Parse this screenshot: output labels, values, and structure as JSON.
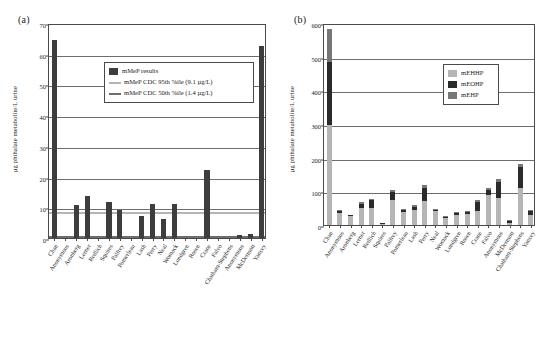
{
  "figure": {
    "panel_a_label": "(a)",
    "panel_b_label": "(b)"
  },
  "chart_data": [
    {
      "type": "bar",
      "panel": "(a)",
      "title": "",
      "xlabel": "",
      "ylabel": "µg phthalate metabolite/L urine",
      "ylim": [
        0,
        70
      ],
      "yticks": [
        0,
        10,
        20,
        30,
        40,
        50,
        60,
        70
      ],
      "grid": true,
      "legend_position": "upper-center",
      "legend": [
        {
          "label": "mMeP results",
          "type": "bar",
          "color": "#3d3d3d"
        },
        {
          "label": "mMeP CDC 95th %ile (9.1 µg/L)",
          "type": "line",
          "color": "#b5b5b5"
        },
        {
          "label": "mMeP CDC 50th %ile (1.4 µg/L)",
          "type": "line",
          "color": "#6d6d6d"
        }
      ],
      "reference_lines": [
        {
          "label": "mMeP CDC 95th %ile",
          "value": 9.1,
          "color": "#b5b5b5"
        },
        {
          "label": "mMeP CDC 50th %ile",
          "value": 1.4,
          "color": "#6d6d6d"
        }
      ],
      "categories": [
        "Chan",
        "Anonymous",
        "Aronberg",
        "Lerner",
        "Redlich",
        "Squires",
        "Palfrey",
        "Pomerleau",
        "Lash",
        "Perry",
        "Neal",
        "Womack",
        "Lundgren",
        "Rosen",
        "Crane",
        "Falvo",
        "Chatham-Stephens",
        "Anonymous",
        "McDermott",
        "Yancey"
      ],
      "series": [
        {
          "name": "mMeP results",
          "color": "#3d3d3d",
          "values": [
            64.5,
            0,
            10.9,
            13.7,
            0,
            11.8,
            9.1,
            0,
            7.2,
            11.2,
            6.2,
            11.2,
            0,
            0,
            22.3,
            0,
            0,
            1.1,
            1.2,
            62.5
          ]
        }
      ]
    },
    {
      "type": "bar",
      "panel": "(b)",
      "stacked": true,
      "title": "",
      "xlabel": "",
      "ylabel": "µg phthalate metabolite/L urine",
      "ylim": [
        0,
        600
      ],
      "yticks": [
        0,
        100,
        200,
        300,
        400,
        500,
        600
      ],
      "grid": true,
      "legend_position": "upper-right",
      "legend": [
        {
          "label": "mEHHP",
          "color": "#b5b5b5"
        },
        {
          "label": "mEOHP",
          "color": "#2b2b2b"
        },
        {
          "label": "mEHP",
          "color": "#777777"
        }
      ],
      "categories": [
        "Chan",
        "Anonymous",
        "Aronberg",
        "Lerner",
        "Redlich",
        "Squires",
        "Palfrey",
        "Pomerleau",
        "Lash",
        "Perry",
        "Neal",
        "Womack",
        "Lundgren",
        "Rosen",
        "Crane",
        "Falvo",
        "Anonymous",
        "McDermott",
        "Chatham-Stephens",
        "Yancey"
      ],
      "series": [
        {
          "name": "mEHHP",
          "color": "#b5b5b5",
          "values": [
            298,
            36,
            27,
            50,
            52,
            6,
            74,
            40,
            44,
            72,
            41,
            22,
            31,
            33,
            43,
            88,
            79,
            5,
            110,
            29
          ]
        },
        {
          "name": "mEOHP",
          "color": "#2b2b2b",
          "values": [
            186,
            6,
            3,
            13,
            21,
            1,
            25,
            5,
            10,
            38,
            4,
            4,
            5,
            6,
            24,
            17,
            50,
            7,
            62,
            12
          ]
        },
        {
          "name": "mEHP",
          "color": "#777777",
          "values": [
            99,
            3,
            0,
            4,
            5,
            0,
            6,
            2,
            4,
            8,
            2,
            1,
            2,
            3,
            6,
            6,
            8,
            3,
            8,
            4
          ]
        }
      ],
      "totals": [
        583,
        45,
        30,
        67,
        78,
        7,
        105,
        47,
        58,
        118,
        47,
        27,
        38,
        42,
        73,
        111,
        137,
        15,
        180,
        45
      ]
    }
  ]
}
